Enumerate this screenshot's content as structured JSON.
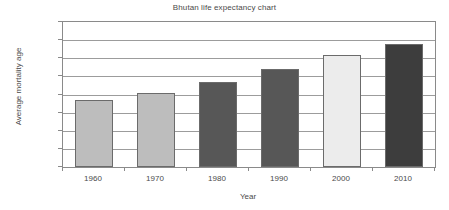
{
  "chart_data": {
    "type": "bar",
    "title": "Bhutan life expectancy chart",
    "xlabel": "Year",
    "ylabel": "Average mortality age",
    "categories": [
      "1960",
      "1970",
      "1980",
      "1990",
      "2000",
      "2010"
    ],
    "values": [
      37,
      41,
      47,
      54,
      62,
      68
    ],
    "series": [
      {
        "name": "Average mortality age",
        "values": [
          37,
          41,
          47,
          54,
          62,
          68
        ]
      }
    ],
    "ylim": [
      0,
      80
    ],
    "yticks": [
      0,
      10,
      20,
      30,
      40,
      50,
      60,
      70,
      80
    ],
    "ytick_labels": [
      "0",
      "10",
      "20",
      "30",
      "40",
      "50",
      "60",
      "70",
      "80"
    ],
    "grid": true,
    "grid_axis": "y",
    "legend": false,
    "legend_position": "none",
    "bar_colors": [
      "#bdbdbd",
      "#bdbdbd",
      "#575757",
      "#575757",
      "#ececec",
      "#3d3d3d"
    ],
    "bar_border_color": "#6b6b6b",
    "gridline_color": "#9c9c9c",
    "axis_color": "#8a8a8a",
    "text_color": "#4a4a4a",
    "background": "#ffffff"
  }
}
